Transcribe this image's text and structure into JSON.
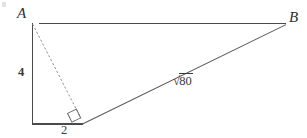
{
  "figure": {
    "background_color": "#ffffff",
    "stroke_color": "#4a4a4a",
    "dash_stroke_color": "#8a8a8a",
    "text_color": "#3a3a3a"
  },
  "labels": {
    "vertex_a": "A",
    "vertex_b": "B",
    "leg_vertical": "4",
    "leg_horizontal": "2",
    "hypotenuse_radical_sign": "√",
    "hypotenuse_radicand": "80",
    "hypotenuse_full": "√80"
  },
  "geometry": {
    "vertex_a": {
      "x": 32,
      "y": 23
    },
    "vertex_b": {
      "x": 286,
      "y": 24
    },
    "corner_bottom_left": {
      "x": 32,
      "y": 124
    },
    "corner_bottom_right": {
      "x": 82,
      "y": 124
    },
    "altitude_foot": {
      "x": 81,
      "y": 118
    },
    "segments": [
      {
        "name": "top-side-AB",
        "from": "vertex_a",
        "to": "vertex_b",
        "style": "solid"
      },
      {
        "name": "left-leg",
        "from": "vertex_a",
        "to": "corner_bottom_left",
        "style": "solid"
      },
      {
        "name": "bottom-leg",
        "from": "corner_bottom_left",
        "to": "corner_bottom_right",
        "style": "solid"
      },
      {
        "name": "hypotenuse",
        "from": "corner_bottom_right",
        "to": "vertex_b",
        "style": "solid"
      },
      {
        "name": "altitude",
        "from": "vertex_a",
        "to": "altitude_foot",
        "style": "dashed"
      }
    ],
    "right_angle_marker": {
      "x": 81,
      "y": 115,
      "size": 10,
      "rotation_deg": -26
    }
  },
  "measurements": {
    "vertical_leg_length": 4,
    "horizontal_leg_length": 2,
    "hypotenuse_length": "√80"
  }
}
